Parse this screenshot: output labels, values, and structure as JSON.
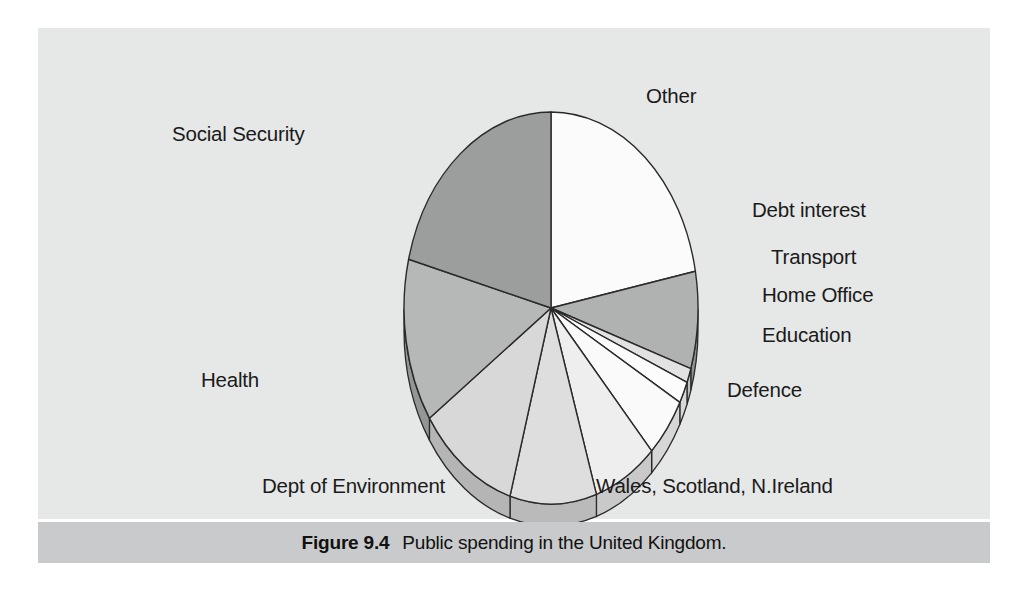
{
  "figure": {
    "caption_number": "Figure 9.4",
    "caption_text": "Public spending in the United Kingdom.",
    "panel_background": "#e6e7e7",
    "caption_background": "#c9cacb",
    "page_background": "#ffffff"
  },
  "chart_data": {
    "type": "pie",
    "title": "Public spending in the United Kingdom.",
    "xlabel": "",
    "ylabel": "",
    "legend_position": "labels-around-pie",
    "grid": false,
    "three_d": true,
    "start_angle_deg": 90,
    "direction": "clockwise",
    "categories": [
      "Other",
      "Debt interest",
      "Transport",
      "Home Office",
      "Education",
      "Defence",
      "Wales, Scotland, N.Ireland",
      "Dept of Environment",
      "Health",
      "Social Security"
    ],
    "values": [
      22.0,
      8.0,
      1.2,
      1.8,
      5.0,
      7.0,
      9.5,
      11.0,
      13.5,
      21.0
    ],
    "slice_colors": [
      "#fbfbfb",
      "#b0b1b1",
      "#e2e2e2",
      "#fcfcfc",
      "#fafafa",
      "#eeeeee",
      "#dedede",
      "#d8d8d8",
      "#b6b7b7",
      "#9c9d9d"
    ],
    "slice_side_colors": [
      "#d5d5d5",
      "#8f9090",
      "#c0c0c0",
      "#d8d8d8",
      "#d6d6d6",
      "#c9c9c9",
      "#bababa",
      "#b5b5b5",
      "#949595",
      "#7f8080"
    ],
    "outline_color": "#2a2a2a"
  },
  "labels": [
    {
      "name": "other",
      "text": "Other",
      "x": 646,
      "y": 84
    },
    {
      "name": "social-security",
      "text": "Social Security",
      "x": 172,
      "y": 122
    },
    {
      "name": "debt-interest",
      "text": "Debt interest",
      "x": 752,
      "y": 198
    },
    {
      "name": "transport",
      "text": "Transport",
      "x": 771,
      "y": 245
    },
    {
      "name": "home-office",
      "text": "Home Office",
      "x": 762,
      "y": 283
    },
    {
      "name": "education",
      "text": "Education",
      "x": 762,
      "y": 323
    },
    {
      "name": "defence",
      "text": "Defence",
      "x": 727,
      "y": 378
    },
    {
      "name": "health",
      "text": "Health",
      "x": 201,
      "y": 368
    },
    {
      "name": "dept-of-environment",
      "text": "Dept of Environment",
      "x": 262,
      "y": 474
    },
    {
      "name": "wales-scotland-nireland",
      "text": "Wales, Scotland, N.Ireland",
      "x": 596,
      "y": 474
    }
  ]
}
